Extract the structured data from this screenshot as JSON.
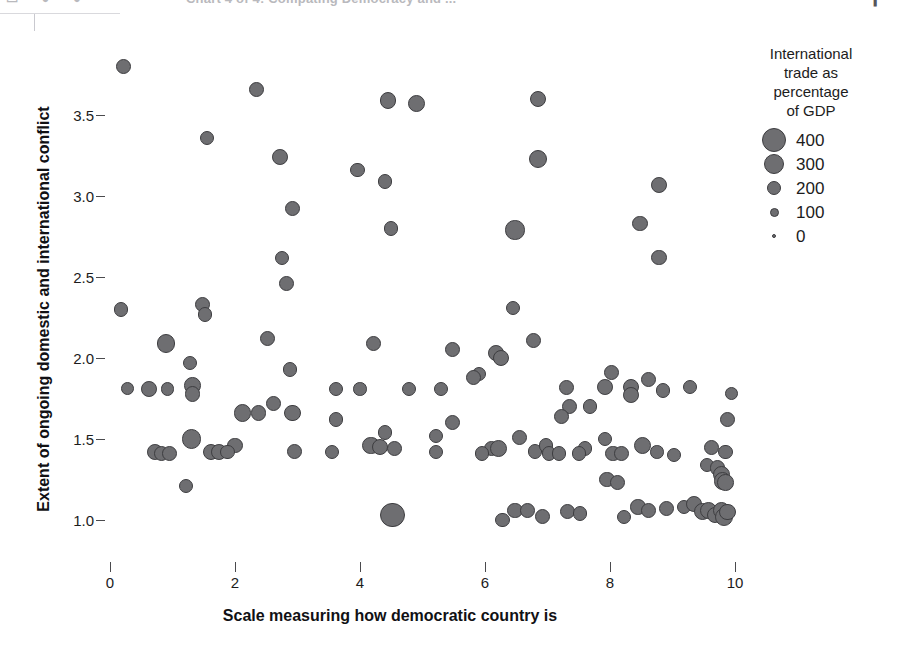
{
  "toolbar": {
    "title_ghost": "Chart 4 of 4: Compating Democracy and ...",
    "icons_ghost": "▭ ● ●",
    "caret_ghost": "▎"
  },
  "chart_data": {
    "type": "scatter",
    "title": "",
    "xlabel": "Scale measuring how democratic country is",
    "ylabel": "Extent of ongoing domestic and international conflict",
    "xlim": [
      -0.3,
      10.5
    ],
    "ylim": [
      0.9,
      3.95
    ],
    "xticks": [
      0,
      2,
      4,
      6,
      8,
      10
    ],
    "xtick_labels": [
      "0",
      "2",
      "4",
      "6",
      "8",
      "10"
    ],
    "yticks": [
      1.0,
      1.5,
      2.0,
      2.5,
      3.0,
      3.5
    ],
    "ytick_labels": [
      "1.0",
      "1.5",
      "2.0",
      "2.5",
      "3.0",
      "3.5"
    ],
    "grid": false,
    "size_encoding": "International trade as percentage of GDP",
    "marker_fill": "#6e6e71",
    "marker_stroke": "#3d3d40",
    "legend": {
      "position": "right",
      "title": "International trade as percentage of GDP",
      "title_lines": [
        "International",
        "trade as",
        "percentage",
        "of GDP"
      ],
      "entries": [
        {
          "label": "400",
          "value": 400,
          "radius_px": 12
        },
        {
          "label": "300",
          "value": 300,
          "radius_px": 10
        },
        {
          "label": "200",
          "value": 200,
          "radius_px": 7
        },
        {
          "label": "100",
          "value": 100,
          "radius_px": 4.5
        },
        {
          "label": "0",
          "value": 0,
          "radius_px": 2
        }
      ]
    },
    "points": [
      {
        "x": 0.21,
        "y": 3.8,
        "size": 120
      },
      {
        "x": 2.35,
        "y": 3.66,
        "size": 120
      },
      {
        "x": 4.45,
        "y": 3.59,
        "size": 150
      },
      {
        "x": 4.9,
        "y": 3.57,
        "size": 180
      },
      {
        "x": 6.85,
        "y": 3.6,
        "size": 150
      },
      {
        "x": 1.55,
        "y": 3.36,
        "size": 100
      },
      {
        "x": 2.72,
        "y": 3.24,
        "size": 140
      },
      {
        "x": 3.96,
        "y": 3.16,
        "size": 110
      },
      {
        "x": 6.85,
        "y": 3.23,
        "size": 200
      },
      {
        "x": 8.78,
        "y": 3.07,
        "size": 140
      },
      {
        "x": 4.4,
        "y": 3.09,
        "size": 120
      },
      {
        "x": 2.92,
        "y": 2.92,
        "size": 120
      },
      {
        "x": 4.5,
        "y": 2.8,
        "size": 110
      },
      {
        "x": 6.48,
        "y": 2.79,
        "size": 230
      },
      {
        "x": 8.48,
        "y": 2.83,
        "size": 130
      },
      {
        "x": 2.75,
        "y": 2.62,
        "size": 100
      },
      {
        "x": 8.78,
        "y": 2.62,
        "size": 140
      },
      {
        "x": 2.82,
        "y": 2.46,
        "size": 120
      },
      {
        "x": 0.18,
        "y": 2.3,
        "size": 110
      },
      {
        "x": 1.48,
        "y": 2.33,
        "size": 130
      },
      {
        "x": 1.52,
        "y": 2.27,
        "size": 110
      },
      {
        "x": 6.45,
        "y": 2.31,
        "size": 110
      },
      {
        "x": 0.9,
        "y": 2.09,
        "size": 210
      },
      {
        "x": 2.52,
        "y": 2.12,
        "size": 130
      },
      {
        "x": 4.22,
        "y": 2.09,
        "size": 120
      },
      {
        "x": 5.48,
        "y": 2.05,
        "size": 120
      },
      {
        "x": 6.17,
        "y": 2.03,
        "size": 140
      },
      {
        "x": 6.25,
        "y": 2.0,
        "size": 150
      },
      {
        "x": 6.78,
        "y": 2.11,
        "size": 120
      },
      {
        "x": 1.28,
        "y": 1.97,
        "size": 110
      },
      {
        "x": 2.88,
        "y": 1.93,
        "size": 120
      },
      {
        "x": 5.9,
        "y": 1.9,
        "size": 110
      },
      {
        "x": 8.03,
        "y": 1.91,
        "size": 120
      },
      {
        "x": 0.28,
        "y": 1.81,
        "size": 80
      },
      {
        "x": 0.62,
        "y": 1.81,
        "size": 140
      },
      {
        "x": 0.92,
        "y": 1.81,
        "size": 90
      },
      {
        "x": 1.32,
        "y": 1.83,
        "size": 160
      },
      {
        "x": 1.32,
        "y": 1.78,
        "size": 140
      },
      {
        "x": 3.62,
        "y": 1.81,
        "size": 100
      },
      {
        "x": 4.0,
        "y": 1.81,
        "size": 90
      },
      {
        "x": 4.78,
        "y": 1.81,
        "size": 100
      },
      {
        "x": 5.3,
        "y": 1.81,
        "size": 100
      },
      {
        "x": 5.82,
        "y": 1.88,
        "size": 130
      },
      {
        "x": 7.3,
        "y": 1.82,
        "size": 120
      },
      {
        "x": 7.92,
        "y": 1.82,
        "size": 140
      },
      {
        "x": 8.33,
        "y": 1.82,
        "size": 150
      },
      {
        "x": 8.33,
        "y": 1.77,
        "size": 140
      },
      {
        "x": 8.62,
        "y": 1.87,
        "size": 120
      },
      {
        "x": 8.85,
        "y": 1.8,
        "size": 110
      },
      {
        "x": 9.28,
        "y": 1.82,
        "size": 110
      },
      {
        "x": 9.95,
        "y": 1.78,
        "size": 80
      },
      {
        "x": 2.62,
        "y": 1.72,
        "size": 120
      },
      {
        "x": 7.35,
        "y": 1.7,
        "size": 130
      },
      {
        "x": 7.68,
        "y": 1.7,
        "size": 110
      },
      {
        "x": 2.12,
        "y": 1.66,
        "size": 190
      },
      {
        "x": 2.38,
        "y": 1.66,
        "size": 130
      },
      {
        "x": 2.92,
        "y": 1.66,
        "size": 150
      },
      {
        "x": 3.62,
        "y": 1.62,
        "size": 110
      },
      {
        "x": 5.48,
        "y": 1.6,
        "size": 130
      },
      {
        "x": 7.22,
        "y": 1.64,
        "size": 130
      },
      {
        "x": 9.88,
        "y": 1.62,
        "size": 130
      },
      {
        "x": 4.4,
        "y": 1.54,
        "size": 120
      },
      {
        "x": 5.22,
        "y": 1.52,
        "size": 110
      },
      {
        "x": 6.55,
        "y": 1.51,
        "size": 120
      },
      {
        "x": 7.92,
        "y": 1.5,
        "size": 110
      },
      {
        "x": 1.3,
        "y": 1.5,
        "size": 240
      },
      {
        "x": 2.0,
        "y": 1.46,
        "size": 130
      },
      {
        "x": 4.18,
        "y": 1.46,
        "size": 190
      },
      {
        "x": 4.32,
        "y": 1.45,
        "size": 150
      },
      {
        "x": 4.55,
        "y": 1.44,
        "size": 120
      },
      {
        "x": 6.1,
        "y": 1.44,
        "size": 120
      },
      {
        "x": 6.22,
        "y": 1.44,
        "size": 180
      },
      {
        "x": 6.8,
        "y": 1.42,
        "size": 120
      },
      {
        "x": 6.98,
        "y": 1.46,
        "size": 110
      },
      {
        "x": 7.6,
        "y": 1.44,
        "size": 120
      },
      {
        "x": 8.52,
        "y": 1.46,
        "size": 170
      },
      {
        "x": 8.75,
        "y": 1.42,
        "size": 90
      },
      {
        "x": 9.62,
        "y": 1.45,
        "size": 120
      },
      {
        "x": 9.85,
        "y": 1.42,
        "size": 110
      },
      {
        "x": 0.72,
        "y": 1.42,
        "size": 140
      },
      {
        "x": 0.82,
        "y": 1.41,
        "size": 130
      },
      {
        "x": 0.95,
        "y": 1.41,
        "size": 120
      },
      {
        "x": 1.62,
        "y": 1.42,
        "size": 150
      },
      {
        "x": 1.75,
        "y": 1.42,
        "size": 140
      },
      {
        "x": 1.88,
        "y": 1.42,
        "size": 110
      },
      {
        "x": 2.95,
        "y": 1.42,
        "size": 120
      },
      {
        "x": 3.55,
        "y": 1.42,
        "size": 110
      },
      {
        "x": 5.22,
        "y": 1.42,
        "size": 110
      },
      {
        "x": 5.95,
        "y": 1.41,
        "size": 110
      },
      {
        "x": 7.02,
        "y": 1.41,
        "size": 110
      },
      {
        "x": 7.18,
        "y": 1.41,
        "size": 110
      },
      {
        "x": 7.5,
        "y": 1.41,
        "size": 110
      },
      {
        "x": 8.05,
        "y": 1.41,
        "size": 140
      },
      {
        "x": 8.18,
        "y": 1.41,
        "size": 120
      },
      {
        "x": 9.02,
        "y": 1.4,
        "size": 110
      },
      {
        "x": 9.55,
        "y": 1.34,
        "size": 110
      },
      {
        "x": 9.72,
        "y": 1.32,
        "size": 130
      },
      {
        "x": 9.78,
        "y": 1.28,
        "size": 170
      },
      {
        "x": 9.8,
        "y": 1.24,
        "size": 180
      },
      {
        "x": 9.85,
        "y": 1.23,
        "size": 160
      },
      {
        "x": 1.22,
        "y": 1.21,
        "size": 110
      },
      {
        "x": 7.95,
        "y": 1.25,
        "size": 130
      },
      {
        "x": 8.12,
        "y": 1.23,
        "size": 120
      },
      {
        "x": 6.48,
        "y": 1.06,
        "size": 130
      },
      {
        "x": 6.68,
        "y": 1.06,
        "size": 120
      },
      {
        "x": 4.52,
        "y": 1.03,
        "size": 420
      },
      {
        "x": 8.22,
        "y": 1.02,
        "size": 110
      },
      {
        "x": 8.45,
        "y": 1.08,
        "size": 130
      },
      {
        "x": 8.62,
        "y": 1.06,
        "size": 120
      },
      {
        "x": 8.9,
        "y": 1.07,
        "size": 130
      },
      {
        "x": 9.18,
        "y": 1.08,
        "size": 110
      },
      {
        "x": 9.35,
        "y": 1.1,
        "size": 140
      },
      {
        "x": 9.48,
        "y": 1.05,
        "size": 170
      },
      {
        "x": 9.58,
        "y": 1.06,
        "size": 180
      },
      {
        "x": 9.68,
        "y": 1.03,
        "size": 150
      },
      {
        "x": 9.78,
        "y": 1.06,
        "size": 170
      },
      {
        "x": 9.82,
        "y": 1.02,
        "size": 190
      },
      {
        "x": 9.88,
        "y": 1.05,
        "size": 150
      },
      {
        "x": 7.32,
        "y": 1.05,
        "size": 120
      },
      {
        "x": 7.52,
        "y": 1.04,
        "size": 110
      },
      {
        "x": 6.92,
        "y": 1.02,
        "size": 130
      },
      {
        "x": 6.28,
        "y": 1.0,
        "size": 120
      }
    ]
  }
}
